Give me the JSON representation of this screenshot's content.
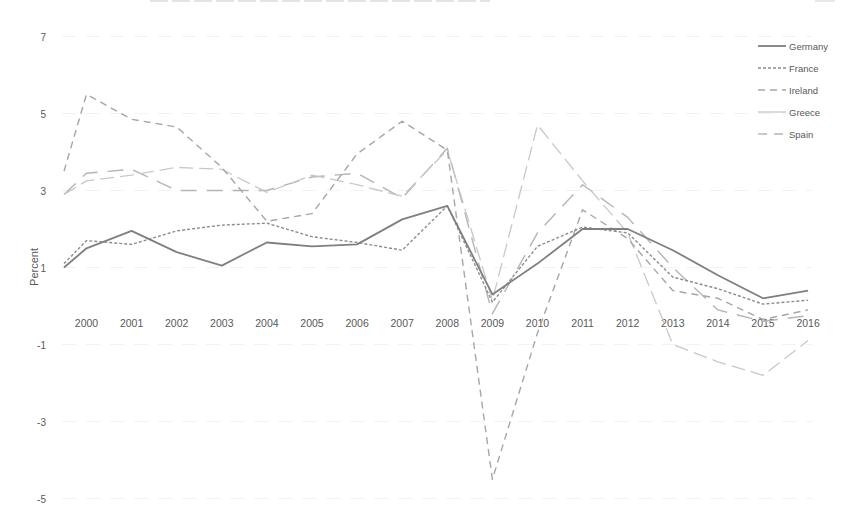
{
  "chart_data": {
    "type": "line",
    "title": "",
    "xlabel": "",
    "ylabel": "Percent",
    "ylim": [
      -5,
      7
    ],
    "yticks": [
      7,
      5,
      3,
      1,
      -1,
      -3,
      -5
    ],
    "grid": false,
    "legend_position": "top-right",
    "categories": [
      "2000",
      "2001",
      "2002",
      "2003",
      "2004",
      "2005",
      "2006",
      "2007",
      "2008",
      "2009",
      "2010",
      "2011",
      "2012",
      "2013",
      "2014",
      "2015",
      "2016"
    ],
    "series": [
      {
        "name": "Germany",
        "style": "solid",
        "color": "#7f7f7f",
        "x": [
          1999.5,
          2000,
          2001,
          2002,
          2003,
          2003.5,
          2004,
          2005,
          2006,
          2007,
          2008,
          2009,
          2010,
          2011,
          2012,
          2013,
          2014,
          2015,
          2016
        ],
        "values": [
          1.0,
          1.5,
          1.95,
          1.4,
          1.05,
          1.35,
          1.65,
          1.55,
          1.6,
          2.25,
          2.6,
          0.3,
          1.1,
          2.0,
          2.0,
          1.45,
          0.8,
          0.2,
          0.4
        ]
      },
      {
        "name": "France",
        "style": "dotted",
        "color": "#8c8c8c",
        "x": [
          1999.5,
          2000,
          2001,
          2002,
          2003,
          2004,
          2005,
          2006,
          2007,
          2008,
          2009,
          2010,
          2011,
          2012,
          2013,
          2014,
          2015,
          2016
        ],
        "values": [
          1.1,
          1.7,
          1.6,
          1.95,
          2.1,
          2.15,
          1.8,
          1.65,
          1.45,
          2.6,
          0.1,
          1.55,
          2.05,
          1.9,
          0.75,
          0.45,
          0.05,
          0.15
        ]
      },
      {
        "name": "Ireland",
        "style": "dashed",
        "color": "#a6a6a6",
        "x": [
          1999.5,
          2000,
          2001,
          2002,
          2003,
          2004,
          2005,
          2006,
          2007,
          2008,
          2009,
          2010,
          2011,
          2012,
          2013,
          2014,
          2015,
          2016
        ],
        "values": [
          3.5,
          5.5,
          4.85,
          4.65,
          3.6,
          2.2,
          2.4,
          3.95,
          4.8,
          4.05,
          -4.5,
          -0.7,
          2.5,
          1.75,
          0.4,
          0.2,
          -0.35,
          -0.1
        ]
      },
      {
        "name": "Greece",
        "style": "light-solid",
        "color": "#c8c8c8",
        "x": [
          1999.5,
          2000,
          2001,
          2002,
          2003,
          2004,
          2005,
          2006,
          2007,
          2008,
          2009,
          2010,
          2011,
          2012,
          2013,
          2014,
          2015,
          2016
        ],
        "values": [
          2.9,
          3.25,
          3.4,
          3.6,
          3.55,
          2.95,
          3.4,
          3.15,
          2.85,
          4.05,
          0.15,
          4.7,
          3.25,
          1.9,
          -1.0,
          -1.45,
          -1.8,
          -0.9
        ]
      },
      {
        "name": "Spain",
        "style": "long-dash",
        "color": "#b5b5b5",
        "x": [
          1999.5,
          2000,
          2001,
          2002,
          2003,
          2004,
          2005,
          2006,
          2007,
          2008,
          2009,
          2010,
          2011,
          2012,
          2013,
          2014,
          2015,
          2016
        ],
        "values": [
          2.9,
          3.45,
          3.55,
          3.0,
          3.0,
          3.0,
          3.35,
          3.45,
          2.8,
          4.1,
          -0.2,
          1.9,
          3.15,
          2.3,
          1.0,
          -0.1,
          -0.4,
          -0.25
        ]
      }
    ]
  },
  "axis": {
    "ylabel": "Percent",
    "yticks": [
      "7",
      "5",
      "3",
      "1",
      "-1",
      "-3",
      "-5"
    ],
    "xticks": [
      "2000",
      "2001",
      "2002",
      "2003",
      "2004",
      "2005",
      "2006",
      "2007",
      "2008",
      "2009",
      "2010",
      "2011",
      "2012",
      "2013",
      "2014",
      "2015",
      "2016"
    ]
  },
  "legend": {
    "items": [
      "Germany",
      "France",
      "Ireland",
      "Greece",
      "Spain"
    ]
  }
}
